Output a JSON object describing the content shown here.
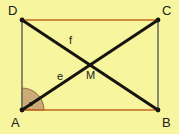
{
  "figure": {
    "name": "rectangle-with-diagonals",
    "canvas": {
      "width": 179,
      "height": 134
    },
    "colors": {
      "background": "#f8f59f",
      "horizontal_edge": "#c1661c",
      "vertical_edge": "#6e7062",
      "diagonal": "#17150f",
      "angle_fill": "#c8a877",
      "angle_stroke": "#8a6a3a",
      "label": "#20201c",
      "vertex_dot": "#17150f"
    },
    "vertices": [
      {
        "id": "A",
        "label": "A",
        "x": 22,
        "y": 110,
        "label_x": 11,
        "label_y": 127
      },
      {
        "id": "B",
        "label": "B",
        "x": 158,
        "y": 110,
        "label_x": 162,
        "label_y": 127
      },
      {
        "id": "C",
        "label": "C",
        "x": 158,
        "y": 20,
        "label_x": 162,
        "label_y": 15
      },
      {
        "id": "D",
        "label": "D",
        "x": 22,
        "y": 20,
        "label_x": 8,
        "label_y": 15
      }
    ],
    "edges": [
      {
        "id": "DC",
        "from": "D",
        "to": "C",
        "kind": "horizontal",
        "x1": 22,
        "y1": 20,
        "x2": 158,
        "y2": 20
      },
      {
        "id": "AB",
        "from": "A",
        "to": "B",
        "kind": "horizontal",
        "x1": 22,
        "y1": 110,
        "x2": 158,
        "y2": 110
      },
      {
        "id": "AD",
        "from": "A",
        "to": "D",
        "kind": "vertical",
        "x1": 22,
        "y1": 110,
        "x2": 22,
        "y2": 20
      },
      {
        "id": "BC",
        "from": "B",
        "to": "C",
        "kind": "vertical",
        "x1": 158,
        "y1": 110,
        "x2": 158,
        "y2": 20
      }
    ],
    "diagonals": [
      {
        "id": "AC",
        "from": "A",
        "to": "C",
        "x1": 22,
        "y1": 110,
        "x2": 158,
        "y2": 20
      },
      {
        "id": "DB",
        "from": "D",
        "to": "B",
        "x1": 22,
        "y1": 20,
        "x2": 158,
        "y2": 110
      }
    ],
    "intersection": {
      "id": "M",
      "label": "M",
      "x": 90,
      "y": 65,
      "label_x": 86,
      "label_y": 79
    },
    "segment_labels": [
      {
        "id": "f",
        "label": "f",
        "on": "DB",
        "x": 69,
        "y": 44
      },
      {
        "id": "e",
        "label": "e",
        "on": "AC",
        "x": 57,
        "y": 80
      }
    ],
    "angle_marker": {
      "at": "A",
      "radius": 22,
      "start_deg": 0,
      "end_deg": 90,
      "dot": {
        "x": 31,
        "y": 104,
        "r": 2
      }
    }
  }
}
